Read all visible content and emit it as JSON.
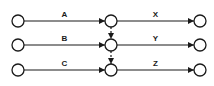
{
  "diagram": {
    "type": "activity-on-arrow network",
    "rows": [
      {
        "left_activity": "A",
        "right_activity": "X"
      },
      {
        "left_activity": "B",
        "right_activity": "Y"
      },
      {
        "left_activity": "C",
        "right_activity": "Z"
      }
    ],
    "dummy_activities": [
      {
        "from_row": 0,
        "to_row": 1
      },
      {
        "from_row": 1,
        "to_row": 2
      }
    ],
    "colors": {
      "stroke": "#1a1a1a",
      "node_fill": "#ffffff"
    }
  }
}
